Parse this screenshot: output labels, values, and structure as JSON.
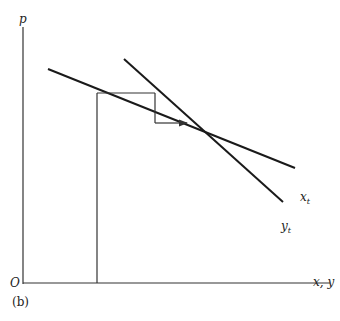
{
  "diagram": {
    "caption": "(b)",
    "axes": {
      "y_label": "p",
      "x_label": "x, y",
      "origin_label": "O"
    },
    "curves": [
      {
        "name": "x",
        "subscript": "t",
        "label": "x_t",
        "from": [
          48,
          69
        ],
        "to": [
          295,
          168
        ]
      },
      {
        "name": "y",
        "subscript": "t",
        "label": "y_t",
        "from": [
          124,
          59
        ],
        "to": [
          283,
          202
        ]
      }
    ],
    "cobweb": {
      "start_vertical": {
        "x": 97,
        "y_top": 93,
        "y_bottom": 283
      },
      "horizontal_1": {
        "y": 93,
        "x_start": 97,
        "x_end": 155
      },
      "vertical_1": {
        "x": 155,
        "y_start": 93,
        "y_end": 123
      },
      "arrow_horizontal": {
        "y": 123,
        "x_start": 155,
        "x_end": 188
      }
    },
    "equilibrium": [
      214,
      152
    ],
    "colors": {
      "line": "#1a1a1a",
      "thin": "#333333",
      "background": "#ffffff"
    }
  }
}
